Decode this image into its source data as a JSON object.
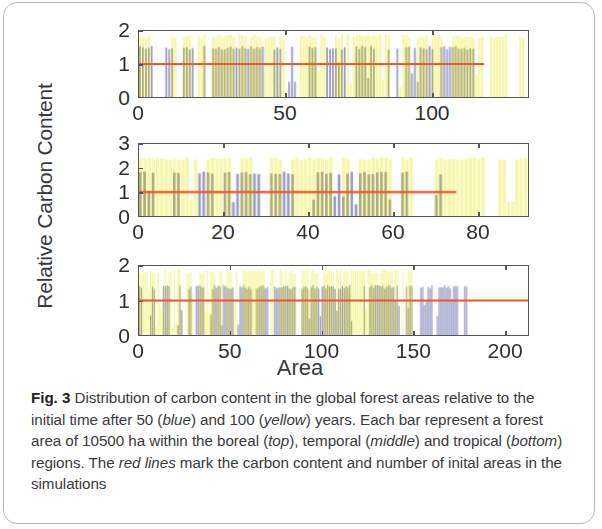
{
  "figure": {
    "label": "Fig. 3",
    "axis_y_label": "Relative Carbon Content",
    "axis_x_label": "Area",
    "caption_segments": [
      {
        "text": "Fig. 3",
        "style": "bold"
      },
      {
        "text": " Distribution of carbon content in the global forest areas relative to the initial time after 50 (",
        "style": "normal"
      },
      {
        "text": "blue",
        "style": "italic"
      },
      {
        "text": ") and 100 (",
        "style": "normal"
      },
      {
        "text": "yellow",
        "style": "italic"
      },
      {
        "text": ") years. Each bar represent a forest area of 10500 ha within the boreal (",
        "style": "normal"
      },
      {
        "text": "top",
        "style": "italic"
      },
      {
        "text": "), temporal (",
        "style": "normal"
      },
      {
        "text": "middle",
        "style": "italic"
      },
      {
        "text": ") and tropical (",
        "style": "normal"
      },
      {
        "text": "bottom",
        "style": "italic"
      },
      {
        "text": ") regions. The ",
        "style": "normal"
      },
      {
        "text": "red lines",
        "style": "italic"
      },
      {
        "text": " mark the carbon content and number of inital areas in the simulations",
        "style": "normal"
      }
    ]
  },
  "colors": {
    "yellow_100yr": "#f7f7a8",
    "blue_50yr": "#9c9ccb",
    "overlap_olive": "#aaaa72",
    "red_line": "#f4512c",
    "axis": "#55565a",
    "text": "#39393b",
    "card_border": "#b9b9b9"
  },
  "legend_meaning": {
    "blue": "after 50 years",
    "yellow": "after 100 years",
    "red_line": "initial carbon content = 1 and number of initial areas"
  },
  "chart_data": {
    "type": "bar",
    "title": "Distribution of carbon content in the global forest areas",
    "xlabel": "Area",
    "ylabel": "Relative Carbon Content",
    "grid": false,
    "legend": {
      "position": "none",
      "entries": [
        {
          "name": "50 years",
          "color": "#9c9ccb"
        },
        {
          "name": "100 years",
          "color": "#f7f7a8"
        }
      ]
    },
    "bar_unit_note": "Each bar represents a forest area of 10500 ha",
    "panels": [
      {
        "id": "top",
        "region": "boreal",
        "ylim": [
          0,
          2
        ],
        "yticks": [
          0,
          1,
          2
        ],
        "xlim": [
          0,
          133
        ],
        "xticks": [
          0,
          50,
          100
        ],
        "xtick_labels": [
          "0",
          "50",
          "100"
        ],
        "reference_line": {
          "y": 1,
          "x_end": 118,
          "color": "#f4512c",
          "meaning": "initial carbon content and number of initial areas"
        },
        "n_areas_50yr": 118,
        "n_areas_100yr": 133,
        "series": [
          {
            "name": "100 years",
            "color": "#f7f7a8",
            "n_bars": 133,
            "value_range": [
              0.05,
              1.95
            ],
            "typical_value": 1.9
          },
          {
            "name": "50 years",
            "color": "#9c9ccb",
            "n_bars": 118,
            "value_range": [
              0.05,
              1.6
            ],
            "typical_value": 1.55
          }
        ]
      },
      {
        "id": "middle",
        "region": "temporal",
        "ylim": [
          0,
          3
        ],
        "yticks": [
          0,
          1,
          2,
          3
        ],
        "xlim": [
          0,
          92
        ],
        "xticks": [
          0,
          20,
          40,
          60,
          80
        ],
        "xtick_labels": [
          "0",
          "20",
          "40",
          "60",
          "80"
        ],
        "reference_line": {
          "y": 1,
          "x_end": 75,
          "color": "#f4512c",
          "meaning": "initial carbon content and number of initial areas"
        },
        "n_areas_50yr": 75,
        "n_areas_100yr": 92,
        "series": [
          {
            "name": "100 years",
            "color": "#f7f7a8",
            "n_bars": 92,
            "value_range": [
              0.1,
              2.55
            ],
            "typical_value": 2.45
          },
          {
            "name": "50 years",
            "color": "#9c9ccb",
            "n_bars": 75,
            "value_range": [
              0.1,
              1.9
            ],
            "typical_value": 1.85
          }
        ]
      },
      {
        "id": "bottom",
        "region": "tropical",
        "ylim": [
          0,
          2
        ],
        "yticks": [
          0,
          1,
          2
        ],
        "xlim": [
          0,
          213
        ],
        "xticks": [
          0,
          50,
          100,
          150,
          200
        ],
        "xtick_labels": [
          "0",
          "50",
          "100",
          "150",
          "200"
        ],
        "reference_line": {
          "y": 1,
          "x_end": 213,
          "color": "#f4512c",
          "meaning": "initial carbon content and number of initial areas"
        },
        "n_areas_50yr": 180,
        "n_areas_100yr": 150,
        "series": [
          {
            "name": "100 years",
            "color": "#f7f7a8",
            "n_bars": 150,
            "value_range": [
              0.05,
              1.95
            ],
            "typical_value": 1.9
          },
          {
            "name": "50 years",
            "color": "#9c9ccb",
            "n_bars": 180,
            "value_range": [
              0.05,
              1.5
            ],
            "typical_value": 1.45
          }
        ]
      }
    ]
  }
}
